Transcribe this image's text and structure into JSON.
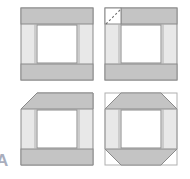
{
  "figure": {
    "caption_label": "A",
    "width": 190,
    "height": 179,
    "background_color": "#ffffff",
    "colors": {
      "band_fill": "#c4c4c4",
      "column_fill": "#e8e8e8",
      "center_fill": "#ffffff",
      "outline": "#8a8a8a",
      "outline_light": "#b0b0b0",
      "dashed_guide": "#6f6f6f",
      "label_color": "#8d93a8"
    },
    "panels": [
      {
        "id": "panel-1",
        "position": "top-left",
        "x": 21,
        "y": 8,
        "width": 72,
        "height": 72,
        "corners_chamfered": [],
        "has_dashed_guide": false,
        "chamfer_size": 0,
        "parts": {
          "top_band": "top horizontal band",
          "bottom_band": "bottom horizontal band",
          "left_column": "left vertical column",
          "right_column": "right vertical column",
          "center": "open center opening"
        }
      },
      {
        "id": "panel-2",
        "position": "top-right",
        "x": 105,
        "y": 8,
        "width": 72,
        "height": 72,
        "corners_chamfered": [],
        "has_dashed_guide": true,
        "dashed_guide_corner": "top-left",
        "chamfer_size": 0
      },
      {
        "id": "panel-3",
        "position": "bottom-left",
        "x": 21,
        "y": 93,
        "width": 72,
        "height": 72,
        "corners_chamfered": [
          "top-left"
        ],
        "has_dashed_guide": false,
        "chamfer_size": 16
      },
      {
        "id": "panel-4",
        "position": "bottom-right",
        "x": 105,
        "y": 93,
        "width": 72,
        "height": 72,
        "corners_chamfered": [
          "top-left",
          "top-right",
          "bottom-left",
          "bottom-right"
        ],
        "has_dashed_guide": false,
        "chamfer_size": 16
      }
    ],
    "geometry": {
      "band_thickness": 16,
      "column_thickness": 14,
      "inner_gap": 2
    }
  }
}
